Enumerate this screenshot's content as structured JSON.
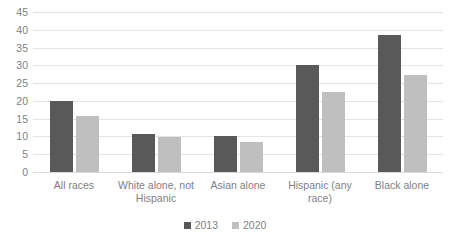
{
  "chart_data": {
    "type": "bar",
    "title": "",
    "subtitle": "",
    "xlabel": "",
    "ylabel": "",
    "ylim": [
      0,
      45
    ],
    "yticks": [
      0,
      5,
      10,
      15,
      20,
      25,
      30,
      35,
      40,
      45
    ],
    "ytick_labels": [
      "0",
      "5",
      "10",
      "15",
      "20",
      "25",
      "30",
      "35",
      "40",
      "45"
    ],
    "grid": "horizontal",
    "legend_position": "bottom-center",
    "categories": [
      "All races",
      "White alone, not Hispanic",
      "Asian alone",
      "Hispanic (any race)",
      "Black alone"
    ],
    "series": [
      {
        "name": "2013",
        "color": "#595959",
        "values": [
          20.0,
          10.6,
          10.0,
          30.2,
          38.5
        ]
      },
      {
        "name": "2020",
        "color": "#bfbfbf",
        "values": [
          15.8,
          9.8,
          8.5,
          22.6,
          27.3
        ]
      }
    ],
    "annotations": []
  },
  "style": {
    "background": "#ffffff",
    "gridline_color": "#e4e4e4",
    "axis_line_color": "#d9d9d9",
    "tick_label_color": "#7f7f7f"
  }
}
